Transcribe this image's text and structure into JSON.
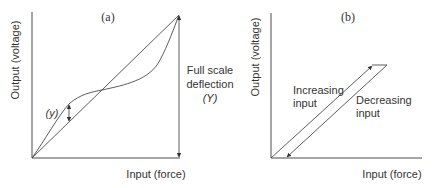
{
  "diagram": {
    "panels": [
      {
        "id": "a",
        "label": "(a)",
        "y_axis_label": "Output (voltage)",
        "x_axis_label": "Input (force)",
        "fsd_label_line1": "Full scale",
        "fsd_label_line2": "deflection",
        "fsd_label_line3": "(Y)",
        "deviation_label": "(y)",
        "description": "Non-linearity: actual S-shaped characteristic vs. ideal straight line from origin to full scale deflection point"
      },
      {
        "id": "b",
        "label": "(b)",
        "y_axis_label": "Output (voltage)",
        "x_axis_label": "Input (force)",
        "increasing_label_line1": "Increasing",
        "increasing_label_line2": "input",
        "decreasing_label_line1": "Decreasing",
        "decreasing_label_line2": "input",
        "description": "Hysteresis: output differs for increasing and decreasing input"
      }
    ],
    "colors": {
      "line": "#4a4a4a",
      "text": "#333333",
      "background": "#ffffff"
    }
  }
}
